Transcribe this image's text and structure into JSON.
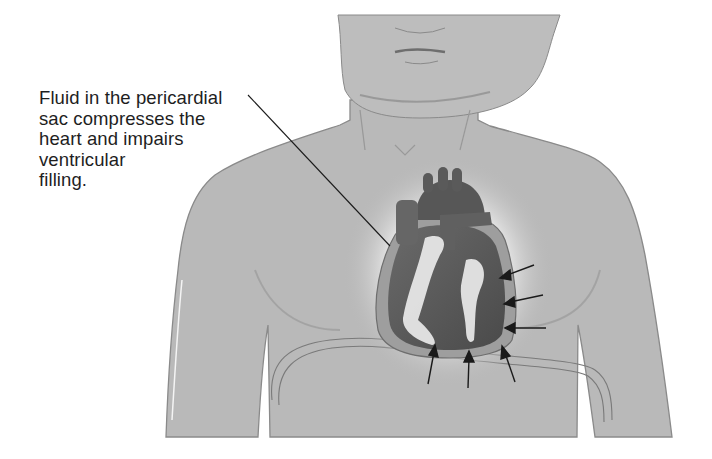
{
  "figure": {
    "callout": {
      "lines": [
        "Fluid in the pericardial",
        "sac compresses the",
        "heart and impairs",
        "ventricular",
        "filling."
      ]
    },
    "labeled_parts": [
      "face-and-neck",
      "torso",
      "heart",
      "pericardial-sac",
      "pericardial-fluid",
      "diaphragm",
      "compression-arrows"
    ],
    "compression_arrow_count": 6,
    "colors": {
      "skin": "#b9b9b9",
      "outline": "#7a7a7a",
      "heart": "#5c5c5c",
      "fluid": "#e6e6e6",
      "sac": "#9a9a9a",
      "glow": "#dcdcdc",
      "text": "#1e1e1e",
      "arrow": "#1a1a1a"
    }
  }
}
